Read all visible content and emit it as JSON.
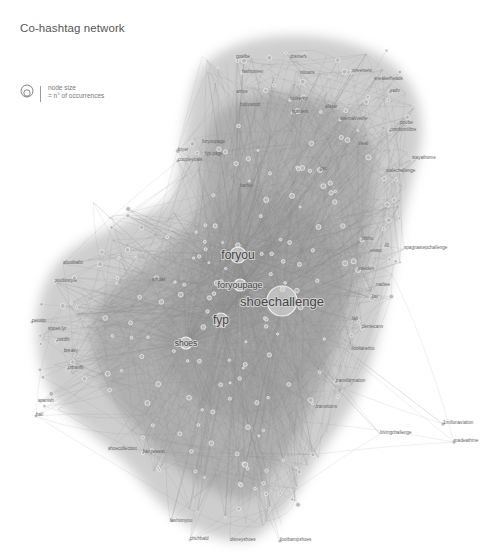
{
  "title": "Co-hashtag network",
  "legend": {
    "icon": "node-size-circles-icon",
    "line1": "node size",
    "line2": "= n° of occurrences"
  },
  "network": {
    "edge_color": "#9a9a9a",
    "node_stroke": "#ffffff",
    "major_nodes": [
      {
        "label": "shoechallenge",
        "x": 282,
        "y": 301,
        "r": 15,
        "font": 13
      },
      {
        "label": "foryou",
        "x": 238,
        "y": 255,
        "r": 8,
        "font": 12
      },
      {
        "label": "fyp",
        "x": 221,
        "y": 320,
        "r": 7,
        "font": 12
      },
      {
        "label": "foryoupage",
        "x": 240,
        "y": 285,
        "r": 6,
        "font": 9
      },
      {
        "label": "shoes",
        "x": 186,
        "y": 343,
        "r": 6,
        "font": 8.5
      }
    ],
    "labels": [
      {
        "text": "goalbe",
        "x": 236,
        "y": 58
      },
      {
        "text": "drainers",
        "x": 290,
        "y": 58
      },
      {
        "text": "fashionrev",
        "x": 242,
        "y": 73
      },
      {
        "text": "niloans",
        "x": 300,
        "y": 74
      },
      {
        "text": "streetsets",
        "x": 352,
        "y": 72
      },
      {
        "text": "sneakerheads",
        "x": 374,
        "y": 80
      },
      {
        "text": "sadv",
        "x": 390,
        "y": 92
      },
      {
        "text": "arrow",
        "x": 236,
        "y": 93
      },
      {
        "text": "lookerstr",
        "x": 290,
        "y": 100
      },
      {
        "text": "hollywood",
        "x": 240,
        "y": 106
      },
      {
        "text": "pothiers",
        "x": 292,
        "y": 113
      },
      {
        "text": "allstar",
        "x": 325,
        "y": 108
      },
      {
        "text": "alternativethe",
        "x": 340,
        "y": 120
      },
      {
        "text": "poobe",
        "x": 400,
        "y": 124
      },
      {
        "text": "combomlibre",
        "x": 390,
        "y": 131
      },
      {
        "text": "trieal",
        "x": 358,
        "y": 145
      },
      {
        "text": "stayathome",
        "x": 412,
        "y": 159
      },
      {
        "text": "foryoupage",
        "x": 202,
        "y": 143
      },
      {
        "text": "foyer",
        "x": 178,
        "y": 151
      },
      {
        "text": "fyp.page",
        "x": 205,
        "y": 155
      },
      {
        "text": "coupleyoals",
        "x": 178,
        "y": 161
      },
      {
        "text": "stalechallenge",
        "x": 386,
        "y": 172
      },
      {
        "text": "gsc",
        "x": 320,
        "y": 170
      },
      {
        "text": "barbie",
        "x": 240,
        "y": 187
      },
      {
        "text": "ig",
        "x": 385,
        "y": 246
      },
      {
        "text": "spagnastepchallenge",
        "x": 404,
        "y": 249
      },
      {
        "text": "tkbhu",
        "x": 362,
        "y": 240
      },
      {
        "text": "eiswo",
        "x": 370,
        "y": 252
      },
      {
        "text": "sweden",
        "x": 358,
        "y": 270
      },
      {
        "text": "nadtee",
        "x": 376,
        "y": 286
      },
      {
        "text": "fav",
        "x": 372,
        "y": 298
      },
      {
        "text": "fail",
        "x": 352,
        "y": 320
      },
      {
        "text": "dentecanv",
        "x": 362,
        "y": 328
      },
      {
        "text": "foollanetho",
        "x": 352,
        "y": 350
      },
      {
        "text": "transformation",
        "x": 336,
        "y": 382
      },
      {
        "text": "transitions",
        "x": 316,
        "y": 408
      },
      {
        "text": "1millonaviation",
        "x": 443,
        "y": 424
      },
      {
        "text": "lovingchallenge",
        "x": 380,
        "y": 434
      },
      {
        "text": "madeathme",
        "x": 454,
        "y": 442
      },
      {
        "text": "afootballo",
        "x": 63,
        "y": 264
      },
      {
        "text": "studiostyle",
        "x": 55,
        "y": 282
      },
      {
        "text": "adidas",
        "x": 152,
        "y": 281
      },
      {
        "text": "petotip",
        "x": 32,
        "y": 322
      },
      {
        "text": "shoes.lyr",
        "x": 48,
        "y": 330
      },
      {
        "text": "ootdfit",
        "x": 57,
        "y": 341
      },
      {
        "text": "breaky",
        "x": 64,
        "y": 352
      },
      {
        "text": "urbanfit",
        "x": 68,
        "y": 369
      },
      {
        "text": "spanish",
        "x": 38,
        "y": 402
      },
      {
        "text": "hail",
        "x": 36,
        "y": 416
      },
      {
        "text": "shoecollection",
        "x": 108,
        "y": 450
      },
      {
        "text": "kanyewest",
        "x": 143,
        "y": 453
      },
      {
        "text": "fashionyou",
        "x": 170,
        "y": 522
      },
      {
        "text": "chuhbald",
        "x": 190,
        "y": 540
      },
      {
        "text": "disneyshoes",
        "x": 230,
        "y": 541
      },
      {
        "text": "footbampshoes",
        "x": 280,
        "y": 541
      }
    ]
  }
}
